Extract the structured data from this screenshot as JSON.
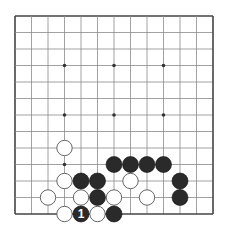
{
  "board": {
    "size": 13,
    "origin_x": 15,
    "origin_y": 16,
    "spacing": 16.5,
    "stone_radius": 8,
    "line_color": "#8a8a8a",
    "border_color": "#444444",
    "background": "#ffffff",
    "black_color": "#2a2a2a",
    "white_color": "#ffffff",
    "white_outline": "#555555",
    "star_points": [
      [
        3,
        3
      ],
      [
        6,
        3
      ],
      [
        9,
        3
      ],
      [
        3,
        6
      ],
      [
        6,
        6
      ],
      [
        9,
        6
      ],
      [
        3,
        9
      ],
      [
        6,
        9
      ],
      [
        9,
        9
      ]
    ],
    "stones": [
      {
        "col": 3,
        "row": 8,
        "color": "white"
      },
      {
        "col": 6,
        "row": 9,
        "color": "black"
      },
      {
        "col": 7,
        "row": 9,
        "color": "black"
      },
      {
        "col": 8,
        "row": 9,
        "color": "black"
      },
      {
        "col": 9,
        "row": 9,
        "color": "black"
      },
      {
        "col": 3,
        "row": 10,
        "color": "white"
      },
      {
        "col": 4,
        "row": 10,
        "color": "black"
      },
      {
        "col": 5,
        "row": 10,
        "color": "black"
      },
      {
        "col": 7,
        "row": 10,
        "color": "white"
      },
      {
        "col": 10,
        "row": 10,
        "color": "black"
      },
      {
        "col": 2,
        "row": 11,
        "color": "white"
      },
      {
        "col": 4,
        "row": 11,
        "color": "white"
      },
      {
        "col": 5,
        "row": 11,
        "color": "black"
      },
      {
        "col": 6,
        "row": 11,
        "color": "white"
      },
      {
        "col": 8,
        "row": 11,
        "color": "white"
      },
      {
        "col": 10,
        "row": 11,
        "color": "black"
      },
      {
        "col": 3,
        "row": 12,
        "color": "white"
      },
      {
        "col": 4,
        "row": 12,
        "color": "black",
        "label": "1"
      },
      {
        "col": 5,
        "row": 12,
        "color": "white"
      },
      {
        "col": 6,
        "row": 12,
        "color": "black"
      }
    ]
  }
}
